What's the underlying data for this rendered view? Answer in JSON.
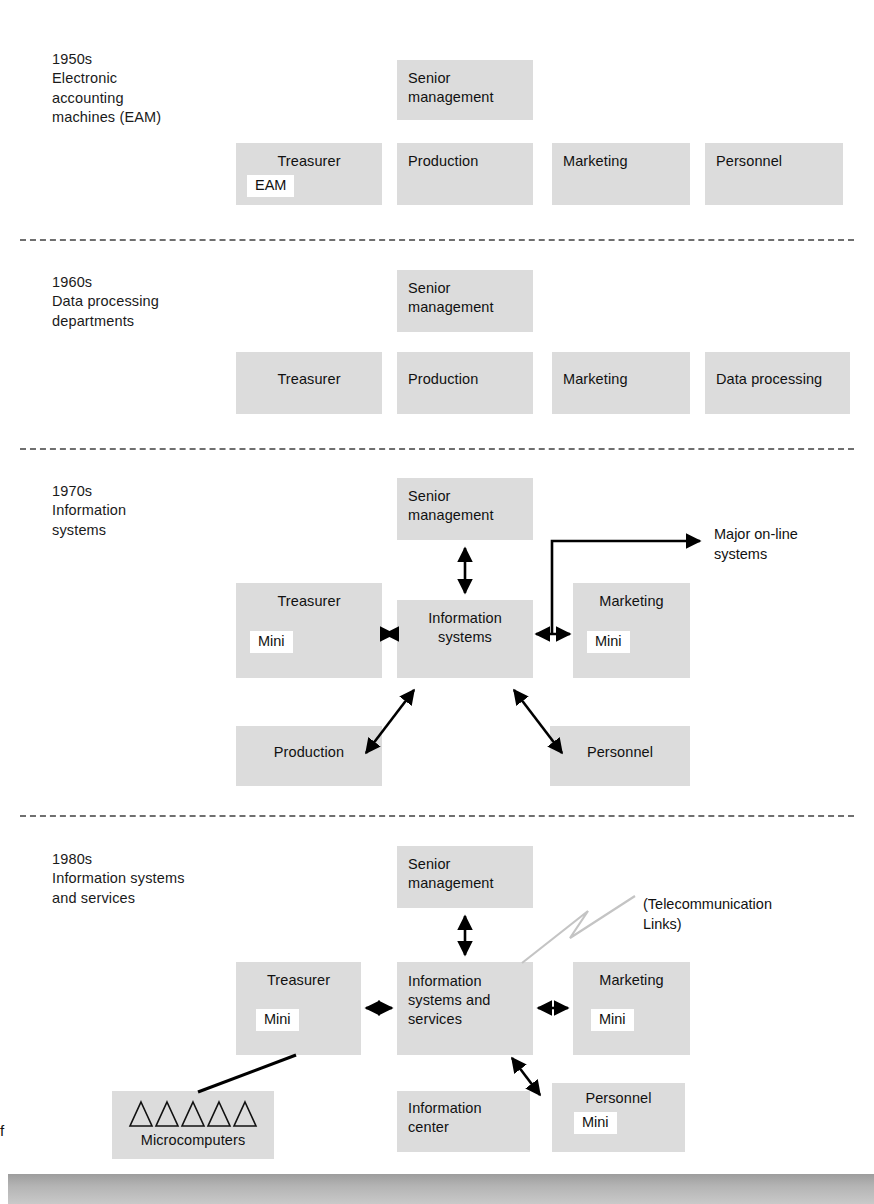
{
  "figure": {
    "type": "organizational-evolution-diagram",
    "background": "#ffffff",
    "box_fill": "#dcdcdc",
    "tag_fill": "#ffffff",
    "line_color": "#000000",
    "separator_color": "#6f6f6f",
    "telecom_line_color": "#c4c4c4"
  },
  "edge_fragment": "f",
  "eras": [
    {
      "id": "1950s",
      "decade": "1950s",
      "caption": "Electronic\naccounting\nmachines (EAM)",
      "boxes": [
        {
          "name": "senior-management",
          "title": "Senior\nmanagement",
          "tag": null
        },
        {
          "name": "treasurer",
          "title": "Treasurer",
          "tag": "EAM"
        },
        {
          "name": "production",
          "title": "Production",
          "tag": null
        },
        {
          "name": "marketing",
          "title": "Marketing",
          "tag": null
        },
        {
          "name": "personnel",
          "title": "Personnel",
          "tag": null
        }
      ]
    },
    {
      "id": "1960s",
      "decade": "1960s",
      "caption": "Data processing\ndepartments",
      "boxes": [
        {
          "name": "senior-management",
          "title": "Senior\nmanagement",
          "tag": null
        },
        {
          "name": "treasurer",
          "title": "Treasurer",
          "tag": null
        },
        {
          "name": "production",
          "title": "Production",
          "tag": null
        },
        {
          "name": "marketing",
          "title": "Marketing",
          "tag": null
        },
        {
          "name": "data-processing",
          "title": "Data processing",
          "tag": null
        }
      ]
    },
    {
      "id": "1970s",
      "decade": "1970s",
      "caption": "Information\nsystems",
      "boxes": [
        {
          "name": "senior-management",
          "title": "Senior\nmanagement",
          "tag": null
        },
        {
          "name": "treasurer",
          "title": "Treasurer",
          "tag": "Mini"
        },
        {
          "name": "information-systems",
          "title": "Information\nsystems",
          "tag": null
        },
        {
          "name": "marketing",
          "title": "Marketing",
          "tag": "Mini"
        },
        {
          "name": "production",
          "title": "Production",
          "tag": null
        },
        {
          "name": "personnel",
          "title": "Personnel",
          "tag": null
        }
      ],
      "annotation": "Major on-line\nsystems"
    },
    {
      "id": "1980s",
      "decade": "1980s",
      "caption": "Information systems\nand services",
      "boxes": [
        {
          "name": "senior-management",
          "title": "Senior\nmanagement",
          "tag": null
        },
        {
          "name": "treasurer",
          "title": "Treasurer",
          "tag": "Mini"
        },
        {
          "name": "information-systems-and-services",
          "title": "Information\nsystems and\nservices",
          "tag": null
        },
        {
          "name": "marketing",
          "title": "Marketing",
          "tag": "Mini"
        },
        {
          "name": "microcomputers",
          "title": "Microcomputers",
          "tag": null,
          "icon": "triangle-row",
          "triangles": 5
        },
        {
          "name": "information-center",
          "title": "Information\ncenter",
          "tag": null
        },
        {
          "name": "personnel",
          "title": "Personnel",
          "tag": "Mini"
        }
      ],
      "annotation": "(Telecommunication\nLinks)"
    }
  ]
}
